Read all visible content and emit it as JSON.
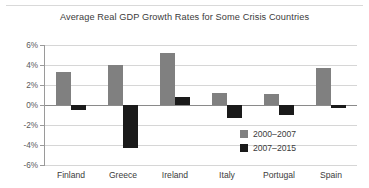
{
  "chart_data": {
    "type": "bar",
    "title": "Average Real GDP Growth Rates for Some Crisis Countries",
    "xlabel": "",
    "ylabel": "",
    "categories": [
      "Finland",
      "Greece",
      "Ireland",
      "Italy",
      "Portugal",
      "Spain"
    ],
    "series": [
      {
        "name": "2000–2007",
        "color": "#808080",
        "values": [
          3.3,
          4.0,
          5.2,
          1.2,
          1.1,
          3.7
        ]
      },
      {
        "name": "2007–2015",
        "color": "#1a1a1a",
        "values": [
          -0.5,
          -4.3,
          0.8,
          -1.3,
          -1.0,
          -0.3
        ]
      }
    ],
    "ylim": [
      -6,
      6
    ],
    "ytick_values": [
      6,
      4,
      2,
      0,
      -2,
      -4,
      -6
    ],
    "ytick_labels": [
      "6%",
      "4%",
      "2%",
      "0%",
      "-2%",
      "-4%",
      "-6%"
    ],
    "grid": true,
    "legend_position": "inside-bottom-right"
  },
  "legend": {
    "entries": [
      {
        "label": "2000–2007",
        "swatch": "#808080"
      },
      {
        "label": "2007–2015",
        "swatch": "#1a1a1a"
      }
    ]
  }
}
